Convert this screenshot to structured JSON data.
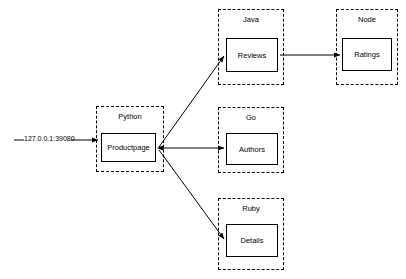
{
  "diagram": {
    "type": "service-dependency-graph",
    "background_color": "#ffffff",
    "line_color": "#000000",
    "ingress": {
      "label": "127.0.0.1:39080",
      "target": "Productpage"
    },
    "clusters": [
      {
        "id": "python",
        "label": "Python",
        "x": 96,
        "y": 106,
        "w": 68,
        "h": 66
      },
      {
        "id": "java",
        "label": "Java",
        "x": 218,
        "y": 9,
        "w": 66,
        "h": 76
      },
      {
        "id": "node",
        "label": "Node",
        "x": 336,
        "y": 9,
        "w": 62,
        "h": 76
      },
      {
        "id": "go",
        "label": "Go",
        "x": 218,
        "y": 107,
        "w": 66,
        "h": 66
      },
      {
        "id": "ruby",
        "label": "Ruby",
        "x": 218,
        "y": 198,
        "w": 66,
        "h": 72
      }
    ],
    "nodes": [
      {
        "id": "productpage",
        "label": "Productpage",
        "cluster": "python",
        "x": 101,
        "y": 133,
        "w": 55,
        "h": 29
      },
      {
        "id": "reviews",
        "label": "Reviews",
        "cluster": "java",
        "x": 226,
        "y": 38,
        "w": 52,
        "h": 34
      },
      {
        "id": "ratings",
        "label": "Ratings",
        "cluster": "node",
        "x": 342,
        "y": 38,
        "w": 50,
        "h": 33
      },
      {
        "id": "authors",
        "label": "Authors",
        "cluster": "go",
        "x": 226,
        "y": 133,
        "w": 52,
        "h": 32
      },
      {
        "id": "details",
        "label": "Details",
        "cluster": "ruby",
        "x": 226,
        "y": 224,
        "w": 52,
        "h": 33
      }
    ],
    "edges": [
      {
        "from": "ingress",
        "to": "productpage",
        "style": "straight"
      },
      {
        "from": "productpage",
        "to": "reviews",
        "style": "diagonal-up"
      },
      {
        "from": "productpage",
        "to": "authors",
        "style": "straight"
      },
      {
        "from": "productpage",
        "to": "details",
        "style": "diagonal-down"
      },
      {
        "from": "reviews",
        "to": "ratings",
        "style": "straight"
      }
    ]
  }
}
